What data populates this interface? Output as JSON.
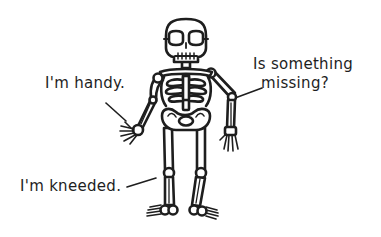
{
  "captions": {
    "handy": "I'm handy.",
    "missing_line1": "Is something",
    "missing_line2": "missing?",
    "kneeded": "I'm kneeded."
  },
  "illustration": {
    "subject": "skeleton-cartoon",
    "stroke_color": "#1e1e1e",
    "fill_color": "#ffffff",
    "background": "#ffffff"
  }
}
